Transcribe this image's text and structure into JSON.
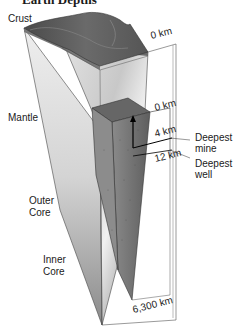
{
  "diagram": {
    "title": "Earth Depths",
    "layer_labels": {
      "crust": "Crust",
      "mantle": "Mantle",
      "outer_core": "Outer Core",
      "outer_core_line1": "Outer",
      "outer_core_line2": "Core",
      "inner_core_line1": "Inner",
      "inner_core_line2": "Core"
    },
    "depth_markers": {
      "surface_top": "0 km",
      "surface_inset": "0 km",
      "mine_depth": "4 km",
      "well_depth": "12 km",
      "center_depth": "6,300 km"
    },
    "callouts": {
      "mine_line1": "Deepest",
      "mine_line2": "mine",
      "well_line1": "Deepest",
      "well_line2": "well"
    },
    "colors": {
      "crust_surface": "#5a5a5a",
      "mantle_face": "#d8d8d8",
      "core_face": "#9a9a9a",
      "inset_block": "#707070",
      "outline": "#333333"
    }
  }
}
